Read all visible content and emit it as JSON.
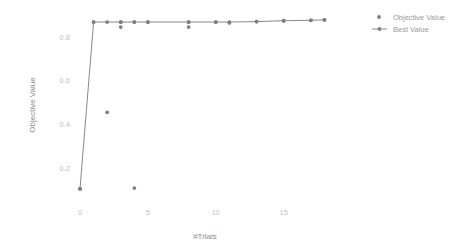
{
  "chart_data": {
    "type": "scatter",
    "title": "",
    "xlabel": "#Trials",
    "ylabel": "Objective Value",
    "xlim": [
      -0.9,
      18.4
    ],
    "ylim": [
      0.045,
      0.935
    ],
    "xticks": [
      0,
      5,
      10,
      15
    ],
    "xtick_labels": [
      "0",
      "5",
      "10",
      "15"
    ],
    "yticks": [
      0.2,
      0.4,
      0.6,
      0.8
    ],
    "ytick_labels": [
      "0.2",
      "0.4",
      "0.6",
      "0.8"
    ],
    "grid": false,
    "legend_position": "top-right",
    "series": [
      {
        "name": "Objective Value",
        "mode": "markers",
        "color": "#7f7f7f",
        "x": [
          0,
          1,
          2,
          3,
          3,
          4,
          4,
          5,
          8,
          8,
          10,
          11,
          13,
          15,
          17,
          18
        ],
        "y": [
          0.105,
          0.868,
          0.455,
          0.868,
          0.845,
          0.108,
          0.868,
          0.868,
          0.868,
          0.845,
          0.868,
          0.864,
          0.87,
          0.874,
          0.876,
          0.878
        ]
      },
      {
        "name": "Best Value",
        "mode": "lines+markers",
        "color": "#7f7f7f",
        "x": [
          0,
          1,
          2,
          3,
          4,
          5,
          8,
          10,
          11,
          13,
          15,
          17,
          18
        ],
        "y": [
          0.105,
          0.868,
          0.868,
          0.868,
          0.868,
          0.868,
          0.868,
          0.868,
          0.868,
          0.87,
          0.874,
          0.876,
          0.878
        ]
      }
    ]
  },
  "legend": {
    "items": [
      {
        "label": "Objective Value",
        "marker": "dot"
      },
      {
        "label": "Best Value",
        "marker": "line-dot"
      }
    ]
  },
  "axes": {
    "x_title": "#Trials",
    "y_title": "Objective Value",
    "x_tick_labels": [
      "0",
      "5",
      "10",
      "15"
    ],
    "y_tick_labels": [
      "0.2",
      "0.4",
      "0.6",
      "0.8"
    ]
  },
  "colors": {
    "marker": "#7f7f7f",
    "line": "#888888",
    "tick": "#bfbfbf",
    "axis_title": "#8a8a8a",
    "legend_text": "#9a9a9a",
    "background": "#ffffff"
  }
}
